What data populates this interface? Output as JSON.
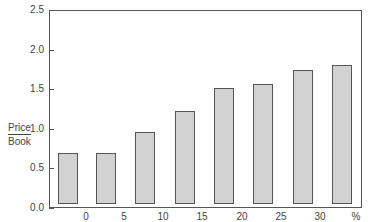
{
  "chart_data": {
    "type": "bar",
    "title": "",
    "xlabel": "%",
    "ylabel": "Price / Book",
    "ylabel_numerator": "Price",
    "ylabel_denominator": "Book",
    "ylim": [
      0,
      2.5
    ],
    "yticks": [
      "0.0",
      "0.5",
      "1.0",
      "1.5",
      "2.0",
      "2.5"
    ],
    "xtick_labels": [
      "0",
      "5",
      "10",
      "15",
      "20",
      "25",
      "30",
      "%"
    ],
    "categories": [
      "<0",
      "0-5",
      "5-10",
      "10-15",
      "15-20",
      "20-25",
      "25-30",
      ">30"
    ],
    "values": [
      0.7,
      0.69,
      0.96,
      1.23,
      1.52,
      1.56,
      1.74,
      1.8
    ],
    "grid": false,
    "legend": null,
    "bar_fill": "stippled grey"
  }
}
